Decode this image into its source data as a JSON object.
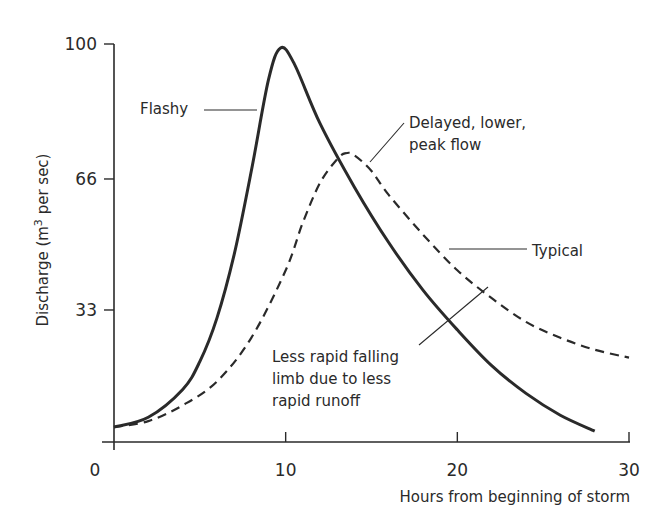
{
  "chart_data": {
    "type": "line",
    "title": "",
    "xlabel": "Hours from beginning of storm",
    "ylabel": "Discharge (m³ per sec)",
    "ylabel_parts": {
      "main": "Discharge (m",
      "sup": "3",
      "tail": " per sec)"
    },
    "xlim": [
      0,
      30
    ],
    "ylim": [
      0,
      100
    ],
    "x_ticks": [
      0,
      10,
      20,
      30
    ],
    "y_ticks": [
      33,
      66,
      100
    ],
    "y_zero_label": "0",
    "grid": false,
    "legend": null,
    "series": [
      {
        "name": "Flashy",
        "style": "solid",
        "x": [
          0,
          2,
          4,
          5,
          6,
          7,
          8,
          9,
          9.7,
          10.5,
          12,
          14,
          16,
          18,
          20,
          22,
          24,
          26,
          28
        ],
        "y": [
          3.5,
          6,
          13,
          20,
          31,
          47,
          68,
          91,
          99,
          95,
          80,
          64,
          50,
          38,
          28,
          19,
          12,
          6.5,
          2.5
        ]
      },
      {
        "name": "Typical",
        "style": "dashed",
        "x": [
          0,
          2,
          4,
          6,
          8,
          10,
          11,
          12,
          13,
          13.5,
          14,
          15,
          16,
          18,
          20,
          22,
          24,
          26,
          28,
          30
        ],
        "y": [
          3.5,
          5,
          9,
          15,
          26,
          43,
          55,
          65,
          71,
          72.5,
          72,
          68,
          62,
          52,
          43,
          36,
          30,
          26,
          23,
          21
        ]
      }
    ],
    "annotations": [
      {
        "id": "flashy",
        "lines": [
          "Flashy"
        ],
        "text_x": 140,
        "text_y": 114,
        "leader": [
          [
            204,
            110
          ],
          [
            257,
            110
          ]
        ]
      },
      {
        "id": "delayed",
        "lines": [
          "Delayed, lower,",
          "peak flow"
        ],
        "text_x": 409,
        "text_y": 128,
        "leader": [
          [
            404,
            123
          ],
          [
            370,
            162
          ]
        ]
      },
      {
        "id": "typical",
        "lines": [
          "Typical"
        ],
        "text_x": 532,
        "text_y": 256,
        "leader": [
          [
            527,
            249
          ],
          [
            449,
            249
          ]
        ]
      },
      {
        "id": "less-rapid",
        "lines": [
          "Less rapid falling",
          "limb due to less",
          "rapid runoff"
        ],
        "text_x": 272,
        "text_y": 362,
        "leader": [
          [
            419,
            345
          ],
          [
            488,
            287
          ]
        ]
      }
    ],
    "bottom_fragment": "Figure caption (cropped, unreadable)"
  },
  "colors": {
    "ink": "#2a2a2a",
    "background": "#ffffff"
  }
}
